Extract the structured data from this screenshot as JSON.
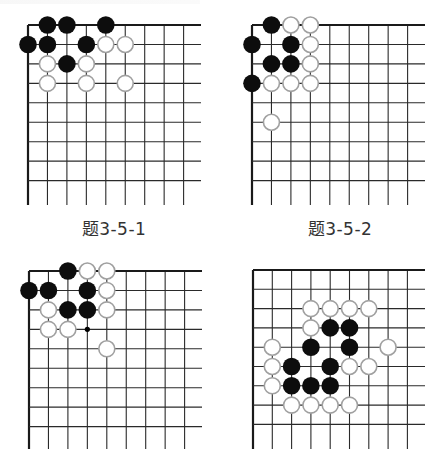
{
  "figure": {
    "captions": [
      "题3-5-1",
      "题3-5-2"
    ]
  },
  "boards": [
    {
      "id": "board-1",
      "caption": "题3-5-1",
      "origin": [
        28,
        25
      ],
      "spacing": 19.45,
      "extent": [
        201,
        205
      ],
      "cols": 9,
      "rows": 9,
      "stones": [
        {
          "c": 1,
          "r": 0,
          "color": "black"
        },
        {
          "c": 2,
          "r": 0,
          "color": "black"
        },
        {
          "c": 4,
          "r": 0,
          "color": "black"
        },
        {
          "c": 0,
          "r": 1,
          "color": "black"
        },
        {
          "c": 1,
          "r": 1,
          "color": "black"
        },
        {
          "c": 3,
          "r": 1,
          "color": "black"
        },
        {
          "c": 4,
          "r": 1,
          "color": "white"
        },
        {
          "c": 5,
          "r": 1,
          "color": "white"
        },
        {
          "c": 1,
          "r": 2,
          "color": "white"
        },
        {
          "c": 2,
          "r": 2,
          "color": "black"
        },
        {
          "c": 3,
          "r": 2,
          "color": "white"
        },
        {
          "c": 1,
          "r": 3,
          "color": "white"
        },
        {
          "c": 3,
          "r": 3,
          "color": "white"
        },
        {
          "c": 5,
          "r": 3,
          "color": "white"
        }
      ],
      "markers": []
    },
    {
      "id": "board-2",
      "caption": "题3-5-2",
      "origin": [
        252,
        25
      ],
      "spacing": 19.45,
      "extent": [
        425,
        205
      ],
      "cols": 9,
      "rows": 9,
      "stones": [
        {
          "c": 1,
          "r": 0,
          "color": "black"
        },
        {
          "c": 2,
          "r": 0,
          "color": "white"
        },
        {
          "c": 3,
          "r": 0,
          "color": "white"
        },
        {
          "c": 0,
          "r": 1,
          "color": "black"
        },
        {
          "c": 2,
          "r": 1,
          "color": "black"
        },
        {
          "c": 3,
          "r": 1,
          "color": "white"
        },
        {
          "c": 1,
          "r": 2,
          "color": "black"
        },
        {
          "c": 2,
          "r": 2,
          "color": "black"
        },
        {
          "c": 3,
          "r": 2,
          "color": "white"
        },
        {
          "c": 0,
          "r": 3,
          "color": "black"
        },
        {
          "c": 1,
          "r": 3,
          "color": "white"
        },
        {
          "c": 2,
          "r": 3,
          "color": "white"
        },
        {
          "c": 3,
          "r": 3,
          "color": "white"
        },
        {
          "c": 1,
          "r": 5,
          "color": "white"
        }
      ],
      "markers": []
    },
    {
      "id": "board-3",
      "caption": "",
      "origin": [
        29,
        271
      ],
      "spacing": 19.45,
      "extent": [
        202,
        449
      ],
      "cols": 9,
      "rows": 9,
      "stones": [
        {
          "c": 2,
          "r": 0,
          "color": "black"
        },
        {
          "c": 3,
          "r": 0,
          "color": "white"
        },
        {
          "c": 4,
          "r": 0,
          "color": "white"
        },
        {
          "c": 0,
          "r": 1,
          "color": "black"
        },
        {
          "c": 1,
          "r": 1,
          "color": "black"
        },
        {
          "c": 3,
          "r": 1,
          "color": "black"
        },
        {
          "c": 4,
          "r": 1,
          "color": "white"
        },
        {
          "c": 1,
          "r": 2,
          "color": "white"
        },
        {
          "c": 2,
          "r": 2,
          "color": "black"
        },
        {
          "c": 3,
          "r": 2,
          "color": "black"
        },
        {
          "c": 4,
          "r": 2,
          "color": "white"
        },
        {
          "c": 1,
          "r": 3,
          "color": "white"
        },
        {
          "c": 2,
          "r": 3,
          "color": "white"
        },
        {
          "c": 4,
          "r": 4,
          "color": "white"
        }
      ],
      "markers": [
        {
          "c": 3,
          "r": 3,
          "type": "dot"
        }
      ]
    },
    {
      "id": "board-4",
      "caption": "",
      "origin": [
        253,
        270
      ],
      "spacing": 19.3,
      "extent": [
        425,
        449
      ],
      "cols": 9,
      "rows": 9,
      "stones": [
        {
          "c": 3,
          "r": 2,
          "color": "white"
        },
        {
          "c": 4,
          "r": 2,
          "color": "white"
        },
        {
          "c": 5,
          "r": 2,
          "color": "white"
        },
        {
          "c": 6,
          "r": 2,
          "color": "white"
        },
        {
          "c": 3,
          "r": 3,
          "color": "white"
        },
        {
          "c": 4,
          "r": 3,
          "color": "black"
        },
        {
          "c": 5,
          "r": 3,
          "color": "black"
        },
        {
          "c": 1,
          "r": 4,
          "color": "white"
        },
        {
          "c": 3,
          "r": 4,
          "color": "black"
        },
        {
          "c": 5,
          "r": 4,
          "color": "black"
        },
        {
          "c": 7,
          "r": 4,
          "color": "white"
        },
        {
          "c": 1,
          "r": 5,
          "color": "white"
        },
        {
          "c": 2,
          "r": 5,
          "color": "black"
        },
        {
          "c": 4,
          "r": 5,
          "color": "black"
        },
        {
          "c": 5,
          "r": 5,
          "color": "white"
        },
        {
          "c": 6,
          "r": 5,
          "color": "white"
        },
        {
          "c": 1,
          "r": 6,
          "color": "white"
        },
        {
          "c": 2,
          "r": 6,
          "color": "black"
        },
        {
          "c": 3,
          "r": 6,
          "color": "black"
        },
        {
          "c": 4,
          "r": 6,
          "color": "black"
        },
        {
          "c": 2,
          "r": 7,
          "color": "white"
        },
        {
          "c": 3,
          "r": 7,
          "color": "white"
        },
        {
          "c": 4,
          "r": 7,
          "color": "white"
        },
        {
          "c": 5,
          "r": 7,
          "color": "white"
        }
      ],
      "markers": []
    }
  ],
  "colors": {
    "grid_line": "#2a2a2a",
    "edge_line": "#1a1a1a",
    "black_stone": "#0d0d0d",
    "white_stone_fill": "#ffffff",
    "white_stone_border": "#a0a0a0",
    "caption_text": "#333333"
  }
}
